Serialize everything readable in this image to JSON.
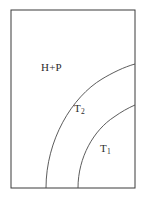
{
  "figure": {
    "type": "phase-region-diagram",
    "background_color": "#ffffff",
    "line_color": "#4a4a4a",
    "frame": {
      "x": 11,
      "y": 10,
      "width": 124,
      "height": 178,
      "stroke_color": "#3a3a3a",
      "stroke_width": 1
    },
    "curves": [
      {
        "name": "outer-boundary-arc",
        "description": "quarter-elliptical arc separating H+P region from T2 region",
        "path": "M 46 188 C 46 140 72 97 102 79 C 112 73 124 67 135 64",
        "start_point": [
          46,
          188
        ],
        "end_point": [
          135,
          64
        ]
      },
      {
        "name": "inner-boundary-arc",
        "description": "quarter-elliptical arc separating T2 region from T1 region",
        "path": "M 78 188 C 78 157 94 130 114 117 C 121 112 128 108 135 105",
        "start_point": [
          78,
          188
        ],
        "end_point": [
          135,
          105
        ]
      }
    ],
    "labels": [
      {
        "name": "label-hp",
        "base": "H+P",
        "subscript": "",
        "x": 41,
        "y": 62,
        "region": "upper-left"
      },
      {
        "name": "label-t2",
        "base": "T",
        "subscript": "2",
        "x": 74,
        "y": 103,
        "region": "middle-band"
      },
      {
        "name": "label-t1",
        "base": "T",
        "subscript": "1",
        "x": 100,
        "y": 143,
        "region": "lower-right"
      }
    ]
  }
}
